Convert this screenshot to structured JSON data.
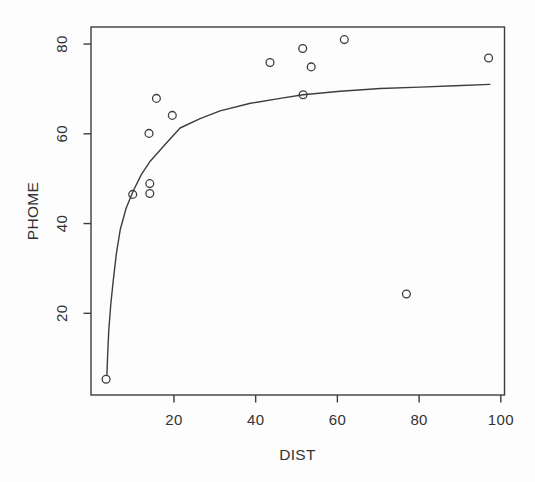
{
  "page": {
    "background": "#fdfdfd"
  },
  "chart_data": {
    "type": "scatter",
    "title": "",
    "xlabel": "DIST",
    "ylabel": "PHOME",
    "xlim": [
      -0.3,
      100.9
    ],
    "ylim": [
      1.8,
      83.8
    ],
    "x_ticks": [
      20,
      40,
      60,
      80,
      100
    ],
    "y_ticks": [
      20,
      40,
      60,
      80
    ],
    "grid": false,
    "frame": "full-box",
    "legend": "none",
    "marker": "open-circle",
    "points": [
      {
        "x": 3.4,
        "y": 5.3
      },
      {
        "x": 9.9,
        "y": 46.5
      },
      {
        "x": 14.1,
        "y": 46.7
      },
      {
        "x": 14.1,
        "y": 48.9
      },
      {
        "x": 13.9,
        "y": 60.1
      },
      {
        "x": 15.7,
        "y": 67.9
      },
      {
        "x": 19.6,
        "y": 64.1
      },
      {
        "x": 43.5,
        "y": 75.9
      },
      {
        "x": 51.5,
        "y": 79.0
      },
      {
        "x": 51.6,
        "y": 68.7
      },
      {
        "x": 53.6,
        "y": 74.9
      },
      {
        "x": 61.7,
        "y": 81.0
      },
      {
        "x": 76.9,
        "y": 24.3
      },
      {
        "x": 97.0,
        "y": 76.9
      }
    ],
    "fit_curve": {
      "description": "smooth asymptotic fit rising steeply from (3.6,6) and leveling off near y=71 at x=97",
      "samples": [
        [
          3.6,
          6.3
        ],
        [
          3.8,
          11.5
        ],
        [
          4.05,
          16.3
        ],
        [
          4.55,
          22.0
        ],
        [
          5.15,
          27.4
        ],
        [
          5.9,
          33.2
        ],
        [
          6.85,
          38.6
        ],
        [
          8.3,
          43.4
        ],
        [
          10.0,
          47.2
        ],
        [
          12.0,
          50.9
        ],
        [
          14.2,
          53.9
        ],
        [
          18.1,
          57.9
        ],
        [
          21.5,
          61.3
        ],
        [
          26.4,
          63.4
        ],
        [
          31.3,
          65.1
        ],
        [
          38.7,
          66.8
        ],
        [
          46.0,
          67.9
        ],
        [
          51.6,
          68.7
        ],
        [
          60.7,
          69.5
        ],
        [
          70.5,
          70.1
        ],
        [
          80.2,
          70.4
        ],
        [
          88.8,
          70.7
        ],
        [
          97.3,
          71.0
        ]
      ]
    },
    "colors": {
      "stroke": "#3d3d3d",
      "text": "#333333",
      "background": "#fdfdfd"
    }
  }
}
